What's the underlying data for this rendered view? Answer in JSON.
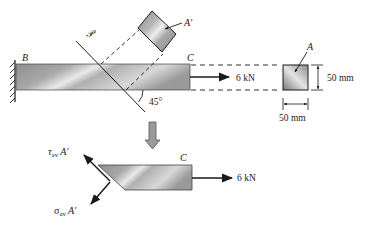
{
  "figure": {
    "labels": {
      "support": "B",
      "plane": "𝒫",
      "end": "C",
      "end_lower": "C",
      "section_area": "A",
      "inclined_area": "A′",
      "angle": "45°",
      "force_top": "6 kN",
      "force_bottom": "6 kN",
      "height_dim": "50 mm",
      "width_dim": "50 mm",
      "tau_symbol": "τ",
      "tau_sub": "av",
      "tau_area": "A′",
      "sigma_symbol": "σ",
      "sigma_sub": "av",
      "sigma_area": "A′"
    },
    "colors": {
      "bar_light": "#e6e6e6",
      "bar_dark": "#7a7a7a",
      "line": "#1a1a1a",
      "arrow_fill": "#9a9a9a"
    }
  }
}
